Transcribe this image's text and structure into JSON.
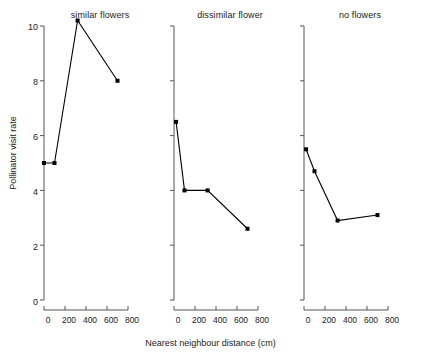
{
  "chart_data": {
    "type": "line",
    "title": "",
    "xlabel": "Nearest neighbour distance (cm)",
    "ylabel": "Pollinator visit rate",
    "xlim": [
      0,
      800
    ],
    "ylim": [
      0,
      10
    ],
    "xticks": [
      0,
      200,
      400,
      600,
      800
    ],
    "xtick_labels": [
      "0",
      "200",
      "400",
      "600",
      "800"
    ],
    "yticks": [
      0,
      2,
      4,
      6,
      8,
      10
    ],
    "ytick_labels": [
      "0",
      "2",
      "4",
      "6",
      "8",
      "10"
    ],
    "grid": false,
    "legend": "none",
    "marker": "filled-square",
    "line_color": "#000000",
    "panels": [
      {
        "title": "similar flowers",
        "x": [
          0,
          100,
          320,
          700
        ],
        "y": [
          5.0,
          5.0,
          10.2,
          8.0
        ]
      },
      {
        "title": "dissimilar flower",
        "x": [
          20,
          100,
          320,
          700
        ],
        "y": [
          6.5,
          4.0,
          4.0,
          2.6
        ]
      },
      {
        "title": "no flowers",
        "x": [
          20,
          100,
          320,
          700
        ],
        "y": [
          5.5,
          4.7,
          2.9,
          3.1
        ]
      }
    ]
  },
  "axes": {
    "y_label": "Pollinator visit rate",
    "x_label": "Nearest neighbour distance (cm)",
    "y_ticks": [
      "0",
      "2",
      "4",
      "6",
      "8",
      "10"
    ],
    "x_ticks": [
      "0",
      "200",
      "400",
      "600",
      "800"
    ]
  },
  "panels": {
    "p0_title": "similar flowers",
    "p1_title": "dissimilar flower",
    "p2_title": "no flowers"
  }
}
